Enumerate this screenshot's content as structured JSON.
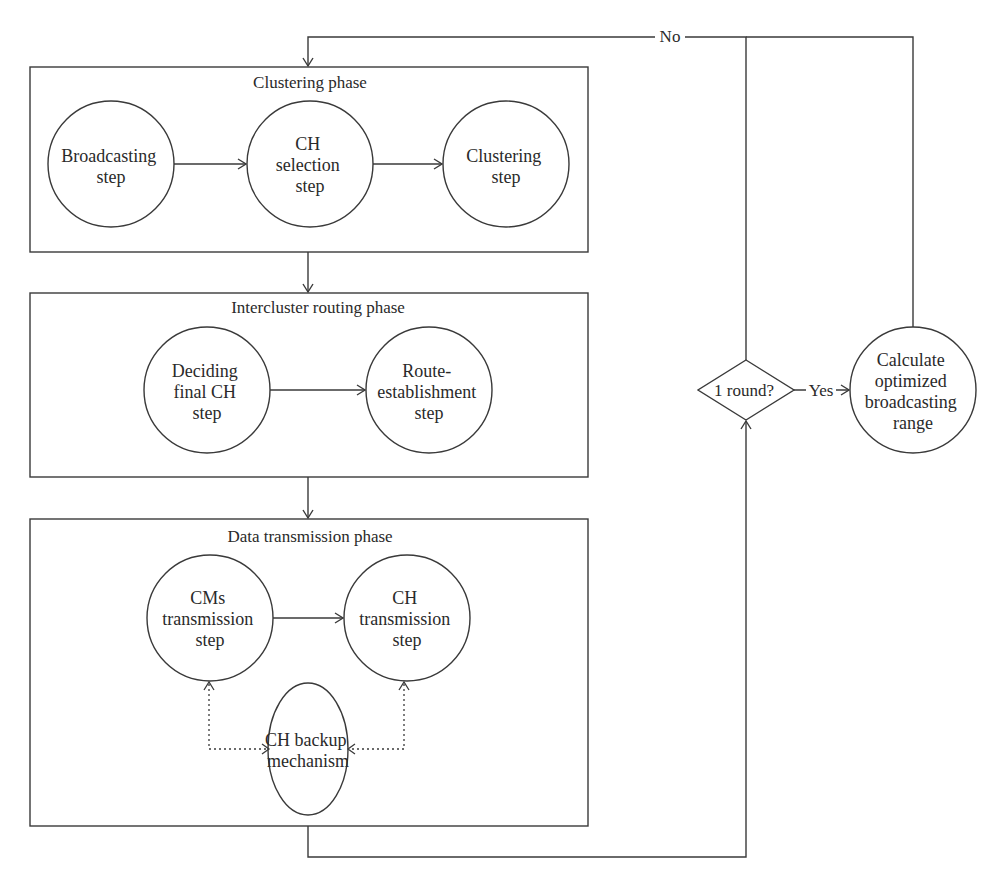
{
  "diagram": {
    "phases": [
      {
        "title": "Clustering phase",
        "nodes": [
          {
            "lines": [
              "Broadcasting",
              "step"
            ]
          },
          {
            "lines": [
              "CH",
              "selection",
              "step"
            ]
          },
          {
            "lines": [
              "Clustering",
              "step"
            ]
          }
        ]
      },
      {
        "title": "Intercluster routing phase",
        "nodes": [
          {
            "lines": [
              "Deciding",
              "final CH",
              "step"
            ]
          },
          {
            "lines": [
              "Route-",
              "establishment",
              "step"
            ]
          }
        ]
      },
      {
        "title": "Data transmission phase",
        "nodes": [
          {
            "lines": [
              "CMs",
              "transmission",
              "step"
            ]
          },
          {
            "lines": [
              "CH",
              "transmission",
              "step"
            ]
          },
          {
            "lines": [
              "CH backup",
              "mechanism"
            ]
          }
        ]
      }
    ],
    "decision": {
      "label": "1 round?",
      "yes_label": "Yes",
      "no_label": "No"
    },
    "calc_node": {
      "lines": [
        "Calculate",
        "optimized",
        "broadcasting",
        "range"
      ]
    },
    "colors": {
      "stroke": "#3a3a3a",
      "background": "#ffffff",
      "text": "#2a2a2a"
    }
  }
}
